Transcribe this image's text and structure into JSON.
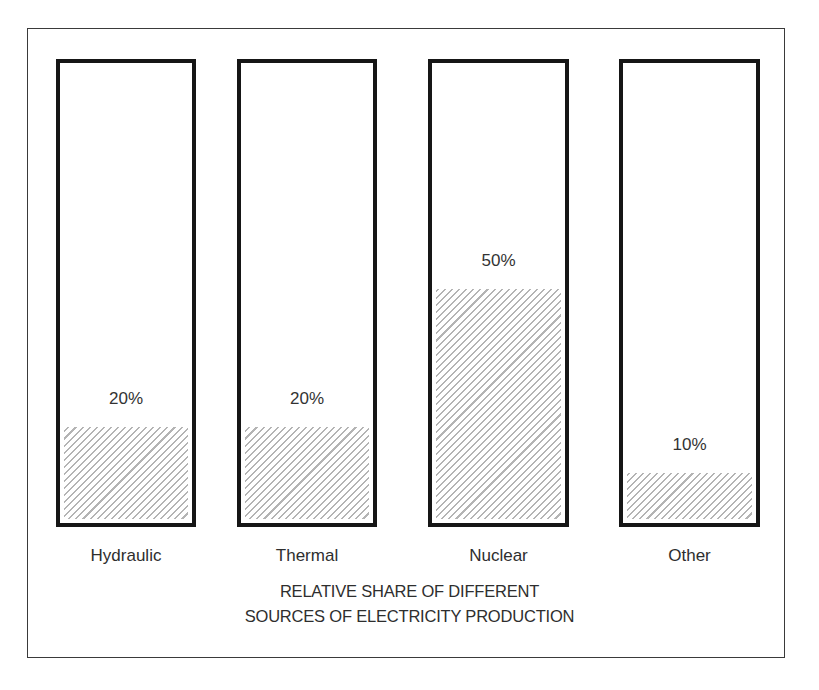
{
  "chart_data": {
    "type": "bar",
    "title_lines": [
      "RELATIVE SHARE OF DIFFERENT",
      "SOURCES OF ELECTRICITY PRODUCTION"
    ],
    "categories": [
      "Hydraulic",
      "Thermal",
      "Nuclear",
      "Other"
    ],
    "values": [
      20,
      20,
      50,
      10
    ],
    "value_labels": [
      "20%",
      "20%",
      "50%",
      "10%"
    ],
    "unit": "%",
    "xlabel": "",
    "ylabel": "",
    "ylim": [
      0,
      100
    ],
    "grid": false,
    "legend": null,
    "fill_pattern": "diagonal-hatch",
    "colors": {
      "bar_border": "#161616",
      "hatch": "#b4b4b4",
      "frame": "#3a3a3a"
    }
  }
}
